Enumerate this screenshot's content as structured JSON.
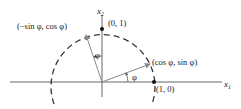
{
  "diagram": {
    "axes": {
      "x1_label": "x",
      "x1_sub": "1",
      "x2_label": "x",
      "x2_sub": "2"
    },
    "points": {
      "e1": "(1, 0)",
      "e2": "(0, 1)",
      "rot_e1": "(cos φ, sin φ)",
      "rot_e2": "(−sin φ, cos φ)"
    },
    "angles": {
      "phi_lower": "φ",
      "phi_upper": "φ"
    },
    "colors": {
      "axis": "#555555",
      "vector": "#888888",
      "circle": "#333333",
      "point": "#111111"
    }
  }
}
